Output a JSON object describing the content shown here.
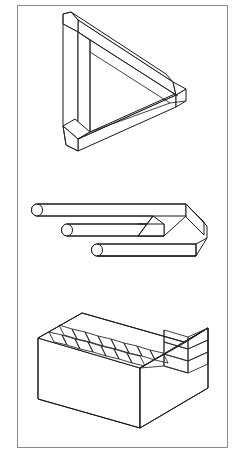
{
  "page": {
    "background_color": "#ffffff",
    "width": 245,
    "height": 463,
    "border_color": "#8a8a8a",
    "ink_color": "#1a1a1a"
  },
  "figures": [
    {
      "id": "penrose-triangle",
      "name": "Penrose triangle",
      "description": "Impossible tribar drawn as three square beams meeting at right angles",
      "order": 1,
      "position": {
        "top": 6,
        "left": 40,
        "width": 130,
        "height": 140
      }
    },
    {
      "id": "impossible-trident",
      "name": "Impossible trident",
      "description": "Blivet / devil's fork with three round prongs merging into a flat two-pronged slab",
      "order": 2,
      "position": {
        "top": 196,
        "left": 30,
        "width": 175,
        "height": 62
      }
    },
    {
      "id": "impossible-staircase",
      "name": "Impossible staircase",
      "description": "Schuster endless staircase block with steps that ascend forever",
      "order": 3,
      "position": {
        "top": 312,
        "left": 35,
        "width": 170,
        "height": 110
      }
    }
  ]
}
